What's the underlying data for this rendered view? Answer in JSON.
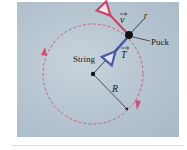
{
  "diagram": {
    "labels": {
      "velocity": "v",
      "radial": "r",
      "puck": "Puck",
      "tension": "T",
      "string": "String",
      "radius": "R"
    },
    "colors": {
      "background": "#b7c5d1",
      "circle": "#c9607a",
      "velocity_arrow": "#c8456a",
      "tension_arrow": "#4a5aa8",
      "string": "#1a1a1a"
    }
  }
}
